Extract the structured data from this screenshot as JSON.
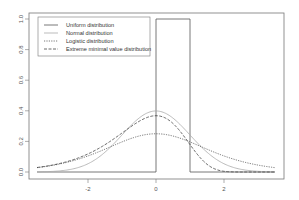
{
  "chart_data": {
    "type": "line",
    "title": "",
    "xlabel": "",
    "ylabel": "",
    "xlim": [
      -3.75,
      3.75
    ],
    "ylim": [
      0,
      1.0
    ],
    "grid": false,
    "legend_position": "top-left",
    "x_ticks": [
      -2,
      0,
      2
    ],
    "x_tick_labels": [
      "-2",
      "0",
      "2"
    ],
    "y_ticks": [
      0.0,
      0.2,
      0.4,
      0.6,
      0.8,
      1.0
    ],
    "y_tick_labels": [
      "0.0",
      "0.2",
      "0.4",
      "0.6",
      "0.8",
      "1.0"
    ],
    "x_range": [
      -3.5,
      3.5
    ],
    "series": [
      {
        "name": "Uniform distribution",
        "style": "solid",
        "color": "#555555",
        "distribution": "uniform",
        "params": {
          "min": 0,
          "max": 1
        },
        "peak": 1.0
      },
      {
        "name": "Normal distribution",
        "style": "solid",
        "color": "#aaaaaa",
        "distribution": "normal",
        "params": {
          "mean": 0,
          "sd": 1
        },
        "peak": 0.4
      },
      {
        "name": "Logistic distribution",
        "style": "dotted",
        "color": "#555555",
        "distribution": "logistic",
        "params": {
          "location": 0,
          "scale": 1
        },
        "peak": 0.25
      },
      {
        "name": "Extreme minimal value distribution",
        "style": "dashed",
        "color": "#444444",
        "distribution": "gumbel-min",
        "params": {
          "location": 0,
          "scale": 1
        },
        "peak": 0.37
      }
    ]
  }
}
